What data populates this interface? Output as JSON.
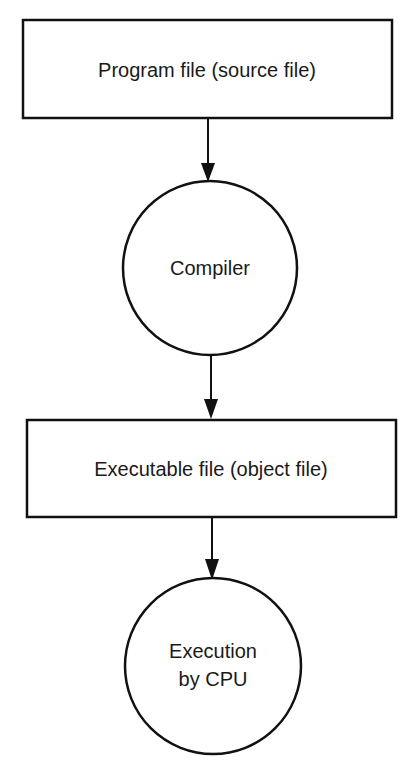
{
  "diagram": {
    "type": "flowchart",
    "nodes": [
      {
        "id": "program",
        "shape": "rectangle",
        "label": "Program file (source file)"
      },
      {
        "id": "compiler",
        "shape": "circle",
        "label": "Compiler"
      },
      {
        "id": "executable",
        "shape": "rectangle",
        "label": "Executable file (object file)"
      },
      {
        "id": "execution",
        "shape": "circle",
        "label_line1": "Execution",
        "label_line2": "by CPU"
      }
    ],
    "edges": [
      {
        "from": "program",
        "to": "compiler"
      },
      {
        "from": "compiler",
        "to": "executable"
      },
      {
        "from": "executable",
        "to": "execution"
      }
    ],
    "colors": {
      "stroke": "#111111",
      "text": "#1a1a1a",
      "background": "#ffffff"
    }
  }
}
